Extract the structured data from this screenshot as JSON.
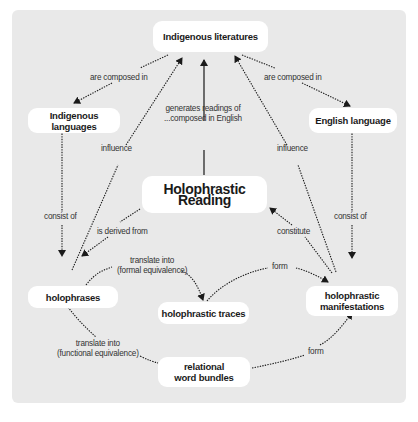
{
  "diagram": {
    "nodes": {
      "indigenous_literatures": "Indigenous literatures",
      "indigenous_languages": "Indigenous languages",
      "english_language": "English language",
      "holophrastic_reading": "Holophrastic Reading",
      "holophrases": "holophrases",
      "holophrastic_traces": "holophrastic traces",
      "holophrastic_manifestations_1": "holophrastic",
      "holophrastic_manifestations_2": "manifestations",
      "relational_word_bundles_1": "relational",
      "relational_word_bundles_2": "word bundles"
    },
    "edges": {
      "lit_to_indlang": "are composed in",
      "lit_to_englang": "are composed in",
      "reading_to_lit_1": "generates readings of",
      "reading_to_lit_2": "...composed in English",
      "holophrases_influence_lit": "influence",
      "manifestations_influence_lit": "influence",
      "indlang_consist_of": "consist of",
      "englang_consist_of": "consist of",
      "reading_derived_from": "is derived from",
      "manifestations_constitute": "constitute",
      "formal_1": "translate into",
      "formal_2": "(formal equivalence)",
      "traces_form": "form",
      "functional_1": "translate into",
      "functional_2": "(functional equivalence)",
      "bundles_form": "form"
    },
    "colors": {
      "background": "#e9e9e9",
      "node_fill": "#ffffff",
      "line": "#1a1a1a"
    }
  },
  "caption": ""
}
